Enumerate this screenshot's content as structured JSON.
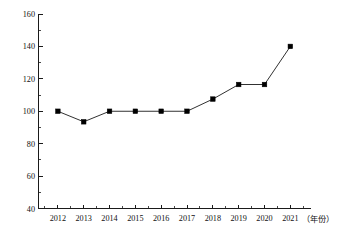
{
  "chart_data": {
    "type": "line",
    "title": "",
    "xlabel": "（年份）",
    "ylabel": "",
    "categories": [
      "2012",
      "2013",
      "2014",
      "2015",
      "2016",
      "2017",
      "2018",
      "2019",
      "2020",
      "2021"
    ],
    "values": [
      100,
      93.5,
      100,
      100,
      100,
      100,
      107.5,
      116.5,
      116.5,
      140
    ],
    "series": [
      {
        "name": "",
        "values": [
          100,
          93.5,
          100,
          100,
          100,
          100,
          107.5,
          116.5,
          116.5,
          140
        ]
      }
    ],
    "ylim": [
      40,
      160
    ],
    "y_ticks": [
      40,
      60,
      80,
      100,
      120,
      140,
      160
    ],
    "y_tick_labels": [
      "40",
      "60",
      "80",
      "100",
      "120",
      "140",
      "160"
    ],
    "y_minor_step": 10,
    "x_ticks": [
      "2012",
      "2013",
      "2014",
      "2015",
      "2016",
      "2017",
      "2018",
      "2019",
      "2020",
      "2021"
    ],
    "grid": false,
    "legend": false,
    "legend_position": "none",
    "marker": "square",
    "marker_color": "#000000",
    "line_color": "#1a1a1a",
    "background_color": "#ffffff",
    "annotations": []
  },
  "axes": {
    "x_unit_label": "（年份）"
  }
}
